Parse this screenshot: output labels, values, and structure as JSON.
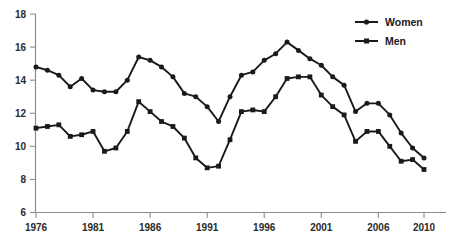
{
  "chart_data": {
    "type": "line",
    "title": "",
    "subtitle": "",
    "xlabel": "",
    "ylabel": "",
    "x": [
      1976,
      1977,
      1978,
      1979,
      1980,
      1981,
      1982,
      1983,
      1984,
      1985,
      1986,
      1987,
      1988,
      1989,
      1990,
      1991,
      1992,
      1993,
      1994,
      1995,
      1996,
      1997,
      1998,
      1999,
      2000,
      2001,
      2002,
      2003,
      2004,
      2005,
      2006,
      2007,
      2008,
      2009,
      2010
    ],
    "xlim": [
      1976,
      2010
    ],
    "ylim": [
      6,
      18
    ],
    "yticks": [
      6,
      8,
      10,
      12,
      14,
      16,
      18
    ],
    "xticks": [
      1976,
      1981,
      1986,
      1991,
      1996,
      2001,
      2006,
      2010
    ],
    "xtick_labels": [
      "1976",
      "1981",
      "1986",
      "1991",
      "1996",
      "2001",
      "2006",
      "2010"
    ],
    "ytick_labels": [
      "6",
      "8",
      "10",
      "12",
      "14",
      "16",
      "18"
    ],
    "grid": false,
    "legend_position": "top-right",
    "series": [
      {
        "name": "Women",
        "marker": "circle",
        "color": "#1a1a1a",
        "values": [
          14.8,
          14.6,
          14.3,
          13.6,
          14.1,
          13.4,
          13.3,
          13.3,
          14.0,
          15.4,
          15.2,
          14.8,
          14.2,
          13.2,
          13.0,
          12.4,
          11.5,
          13.0,
          14.3,
          14.5,
          15.2,
          15.6,
          16.3,
          15.8,
          15.3,
          14.9,
          14.2,
          13.7,
          12.1,
          12.6,
          12.6,
          11.9,
          10.8,
          9.9,
          9.3
        ]
      },
      {
        "name": "Men",
        "marker": "square",
        "color": "#1a1a1a",
        "values": [
          11.1,
          11.2,
          11.3,
          10.6,
          10.7,
          10.9,
          9.7,
          9.9,
          10.9,
          12.7,
          12.1,
          11.5,
          11.2,
          10.5,
          9.3,
          8.7,
          8.8,
          10.4,
          12.1,
          12.2,
          12.1,
          13.0,
          14.1,
          14.2,
          14.2,
          13.1,
          12.4,
          11.9,
          10.3,
          10.9,
          10.9,
          10.0,
          9.1,
          9.2,
          8.6
        ]
      }
    ],
    "legend": [
      {
        "label": "Women",
        "marker": "circle"
      },
      {
        "label": "Men",
        "marker": "square"
      }
    ]
  }
}
